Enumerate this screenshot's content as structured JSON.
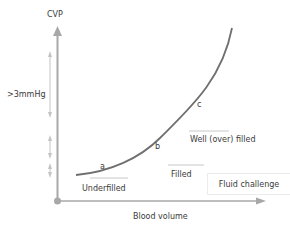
{
  "diagram": {
    "axes": {
      "y_label": "CVP",
      "x_label": "Blood volume"
    },
    "curve_points": {
      "a": "a",
      "b": "b",
      "c": "c"
    },
    "zones": [
      {
        "label": "Underfilled"
      },
      {
        "label": "Filled"
      },
      {
        "label": "Well (over) filled"
      }
    ],
    "threshold_label": ">3mmHg",
    "legend_box": "Fluid challenge",
    "colors": {
      "axis": "#a8a8a8",
      "curve": "#6f6f6f",
      "guide_arrows": "#c4c4c4",
      "zone_lines": "#c8c8c8",
      "text": "#3a3a3a"
    }
  }
}
